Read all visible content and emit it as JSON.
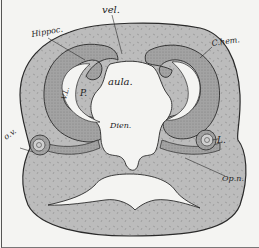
{
  "figure": {
    "colors": {
      "background": "#f4f4f2",
      "tissue_fill": "#bdbdbd",
      "wall_fill": "#a8a8a8",
      "outline": "#2a2a2a",
      "cavity": "#f4f4f2"
    },
    "labels": {
      "vel": "vel.",
      "hippoc": "Hippoc.",
      "chem": "C.hem.",
      "vl": "V.L.",
      "p": "P.",
      "aula": "aula.",
      "dien": "Dien.",
      "ov": "o.v.",
      "l": "L.",
      "opn": "Op.n."
    }
  }
}
